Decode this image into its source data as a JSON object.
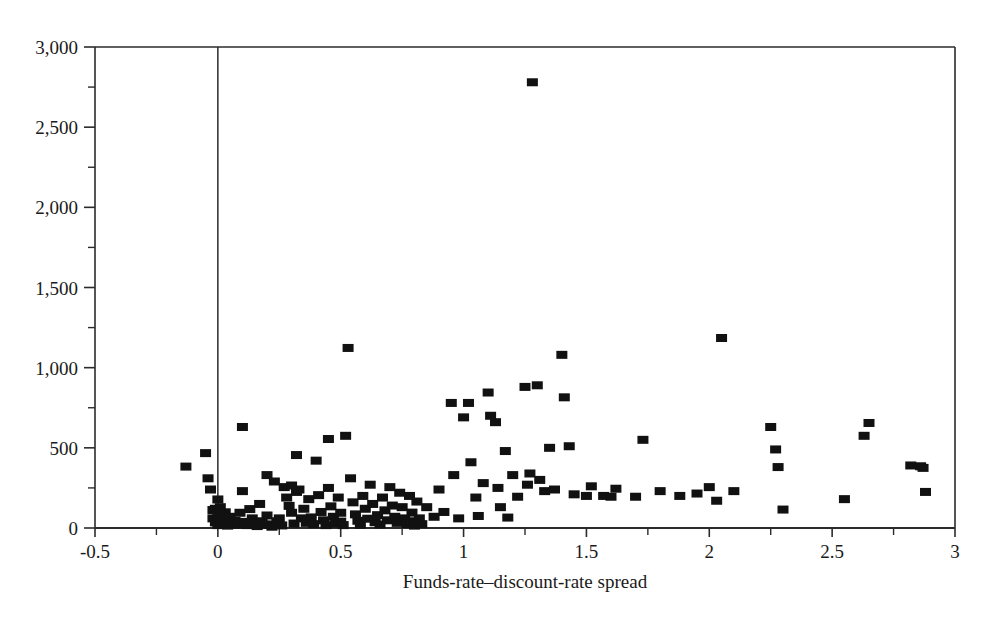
{
  "chart_data": {
    "type": "scatter",
    "title": "",
    "subtitle": "",
    "xlabel": "Funds-rate–discount-rate spread",
    "ylabel": "",
    "xlim": [
      -0.5,
      3
    ],
    "ylim": [
      0,
      3000
    ],
    "xticks": [
      -0.5,
      0,
      0.5,
      1,
      1.5,
      2,
      2.5,
      3
    ],
    "xticklabels": [
      "-0.5",
      "0",
      "0.5",
      "1",
      "1.5",
      "2",
      "2.5",
      "3"
    ],
    "xminorticks": [
      -0.25,
      0.25,
      0.75,
      1.25,
      1.75,
      2.25,
      2.75
    ],
    "yticks": [
      0,
      500,
      1000,
      1500,
      2000,
      2500,
      3000
    ],
    "yticklabels": [
      "0",
      "500",
      "1,000",
      "1,500",
      "2,000",
      "2,500",
      "3,000"
    ],
    "yminorticks": [
      250,
      750,
      1250,
      1750,
      2250,
      2750
    ],
    "grid": false,
    "legend": null,
    "marker": {
      "shape": "square",
      "color": "#111111",
      "width_px": 11,
      "height_px": 8
    },
    "frame": {
      "top": true,
      "right": true,
      "bottom": true,
      "left": true,
      "vertical_reference_line_x": 0
    },
    "n_points": 176,
    "points": [
      [
        -0.13,
        383
      ],
      [
        -0.05,
        467
      ],
      [
        -0.04,
        310
      ],
      [
        -0.03,
        240
      ],
      [
        -0.02,
        112
      ],
      [
        -0.02,
        60
      ],
      [
        -0.01,
        120
      ],
      [
        -0.01,
        35
      ],
      [
        0.0,
        178
      ],
      [
        0.0,
        88
      ],
      [
        0.0,
        50
      ],
      [
        0.0,
        18
      ],
      [
        0.01,
        130
      ],
      [
        0.02,
        60
      ],
      [
        0.02,
        22
      ],
      [
        0.03,
        98
      ],
      [
        0.04,
        40
      ],
      [
        0.04,
        15
      ],
      [
        0.05,
        70
      ],
      [
        0.06,
        28
      ],
      [
        0.07,
        45
      ],
      [
        0.08,
        20
      ],
      [
        0.09,
        95
      ],
      [
        0.1,
        630
      ],
      [
        0.1,
        230
      ],
      [
        0.11,
        38
      ],
      [
        0.12,
        18
      ],
      [
        0.13,
        118
      ],
      [
        0.14,
        60
      ],
      [
        0.15,
        30
      ],
      [
        0.16,
        12
      ],
      [
        0.17,
        150
      ],
      [
        0.18,
        42
      ],
      [
        0.19,
        20
      ],
      [
        0.2,
        330
      ],
      [
        0.2,
        78
      ],
      [
        0.21,
        22
      ],
      [
        0.22,
        8
      ],
      [
        0.23,
        290
      ],
      [
        0.24,
        42
      ],
      [
        0.25,
        60
      ],
      [
        0.26,
        16
      ],
      [
        0.27,
        255
      ],
      [
        0.28,
        190
      ],
      [
        0.29,
        138
      ],
      [
        0.3,
        265
      ],
      [
        0.3,
        95
      ],
      [
        0.31,
        28
      ],
      [
        0.32,
        455
      ],
      [
        0.32,
        225
      ],
      [
        0.33,
        240
      ],
      [
        0.34,
        60
      ],
      [
        0.35,
        120
      ],
      [
        0.36,
        32
      ],
      [
        0.37,
        180
      ],
      [
        0.38,
        66
      ],
      [
        0.39,
        24
      ],
      [
        0.4,
        420
      ],
      [
        0.41,
        205
      ],
      [
        0.42,
        100
      ],
      [
        0.43,
        48
      ],
      [
        0.44,
        18
      ],
      [
        0.45,
        555
      ],
      [
        0.45,
        250
      ],
      [
        0.46,
        135
      ],
      [
        0.47,
        70
      ],
      [
        0.48,
        28
      ],
      [
        0.49,
        190
      ],
      [
        0.5,
        95
      ],
      [
        0.5,
        40
      ],
      [
        0.51,
        18
      ],
      [
        0.52,
        575
      ],
      [
        0.53,
        1123
      ],
      [
        0.54,
        310
      ],
      [
        0.55,
        160
      ],
      [
        0.56,
        85
      ],
      [
        0.57,
        45
      ],
      [
        0.58,
        20
      ],
      [
        0.59,
        200
      ],
      [
        0.6,
        120
      ],
      [
        0.61,
        58
      ],
      [
        0.62,
        270
      ],
      [
        0.63,
        150
      ],
      [
        0.64,
        36
      ],
      [
        0.65,
        80
      ],
      [
        0.66,
        22
      ],
      [
        0.67,
        190
      ],
      [
        0.68,
        110
      ],
      [
        0.69,
        48
      ],
      [
        0.7,
        255
      ],
      [
        0.71,
        140
      ],
      [
        0.72,
        70
      ],
      [
        0.73,
        32
      ],
      [
        0.74,
        220
      ],
      [
        0.75,
        130
      ],
      [
        0.76,
        60
      ],
      [
        0.77,
        25
      ],
      [
        0.78,
        200
      ],
      [
        0.79,
        96
      ],
      [
        0.8,
        42
      ],
      [
        0.8,
        15
      ],
      [
        0.81,
        165
      ],
      [
        0.82,
        60
      ],
      [
        0.83,
        24
      ],
      [
        0.85,
        130
      ],
      [
        0.88,
        70
      ],
      [
        0.9,
        240
      ],
      [
        0.92,
        100
      ],
      [
        0.95,
        780
      ],
      [
        0.96,
        330
      ],
      [
        0.98,
        60
      ],
      [
        1.0,
        690
      ],
      [
        1.02,
        780
      ],
      [
        1.03,
        410
      ],
      [
        1.05,
        190
      ],
      [
        1.06,
        75
      ],
      [
        1.08,
        280
      ],
      [
        1.1,
        845
      ],
      [
        1.11,
        700
      ],
      [
        1.13,
        660
      ],
      [
        1.14,
        250
      ],
      [
        1.15,
        130
      ],
      [
        1.17,
        480
      ],
      [
        1.18,
        65
      ],
      [
        1.2,
        330
      ],
      [
        1.22,
        195
      ],
      [
        1.25,
        880
      ],
      [
        1.26,
        270
      ],
      [
        1.27,
        340
      ],
      [
        1.28,
        2780
      ],
      [
        1.3,
        890
      ],
      [
        1.31,
        300
      ],
      [
        1.33,
        230
      ],
      [
        1.35,
        500
      ],
      [
        1.37,
        240
      ],
      [
        1.4,
        1080
      ],
      [
        1.41,
        815
      ],
      [
        1.43,
        510
      ],
      [
        1.45,
        210
      ],
      [
        1.5,
        200
      ],
      [
        1.52,
        260
      ],
      [
        1.57,
        200
      ],
      [
        1.6,
        195
      ],
      [
        1.62,
        245
      ],
      [
        1.7,
        195
      ],
      [
        1.73,
        550
      ],
      [
        1.8,
        230
      ],
      [
        1.88,
        200
      ],
      [
        1.95,
        215
      ],
      [
        2.0,
        255
      ],
      [
        2.03,
        170
      ],
      [
        2.05,
        1185
      ],
      [
        2.1,
        230
      ],
      [
        2.25,
        630
      ],
      [
        2.27,
        490
      ],
      [
        2.28,
        380
      ],
      [
        2.3,
        115
      ],
      [
        2.55,
        180
      ],
      [
        2.63,
        575
      ],
      [
        2.65,
        655
      ],
      [
        2.82,
        390
      ],
      [
        2.86,
        385
      ],
      [
        2.87,
        375
      ],
      [
        2.88,
        225
      ]
    ]
  }
}
